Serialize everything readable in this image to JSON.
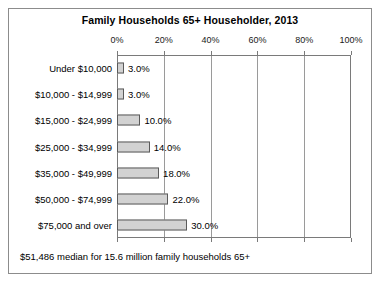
{
  "chart_data": {
    "type": "bar",
    "orientation": "horizontal",
    "title": "Family Households 65+ Householder, 2013",
    "xlabel": "",
    "ylabel": "",
    "xlim": [
      0,
      100
    ],
    "grid": true,
    "legend": null,
    "xtick_labels": [
      "0%",
      "20%",
      "40%",
      "60%",
      "80%",
      "100%"
    ],
    "xticks": [
      0,
      20,
      40,
      60,
      80,
      100
    ],
    "categories": [
      "Under $10,000",
      "$10,000 - $14,999",
      "$15,000 - $24,999",
      "$25,000 - $34,999",
      "$35,000 - $49,999",
      "$50,000 - $74,999",
      "$75,000 and over"
    ],
    "values": [
      3.0,
      3.0,
      10.0,
      14.0,
      18.0,
      22.0,
      30.0
    ],
    "data_labels": [
      "3.0%",
      "3.0%",
      "10.0%",
      "14.0%",
      "18.0%",
      "22.0%",
      "30.0%"
    ],
    "annotation": "$51,486 median for 15.6 million family households 65+",
    "colors": {
      "bar_fill": "#d2d2d2",
      "bar_border": "#5a5a5a",
      "gridline": "#9a9a9a",
      "frame": "#7a7a7a",
      "outer_frame": "#8c8c8c",
      "text": "#000000",
      "background": "#ffffff"
    }
  }
}
